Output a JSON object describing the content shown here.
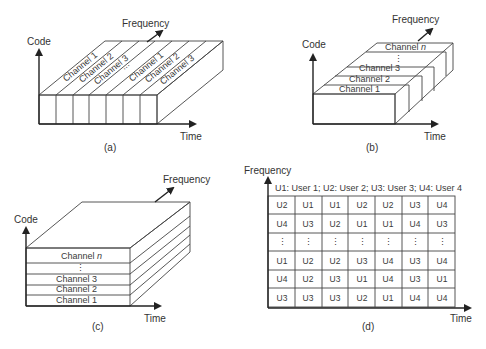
{
  "figure": {
    "panels": [
      {
        "id": "a",
        "caption": "(a)",
        "axes": {
          "x": "Time",
          "y": "Code",
          "z": "Frequency"
        },
        "channels": [
          "Channel 1",
          "Channel 2",
          "Channel 3",
          "...",
          "Channel 1",
          "Channel 2",
          "Channel 3"
        ],
        "time_slots": 7
      },
      {
        "id": "b",
        "caption": "(b)",
        "axes": {
          "x": "Time",
          "y": "Code",
          "z": "Frequency"
        },
        "channels": [
          "Channel 1",
          "Channel 2",
          "Channel 3",
          "⋮",
          "Channel n"
        ]
      },
      {
        "id": "c",
        "caption": "(c)",
        "axes": {
          "x": "Time",
          "y": "Code",
          "z": "Frequency"
        },
        "channels": [
          "Channel 1",
          "Channel 2",
          "Channel 3",
          "⋮",
          "Channel n"
        ]
      },
      {
        "id": "d",
        "caption": "(d)",
        "axes": {
          "x": "Time",
          "y": "Frequency"
        },
        "legend": "U1: User 1; U2: User 2;  U3: User 3;  U4: User 4",
        "grid": [
          [
            "U2",
            "U1",
            "U1",
            "U2",
            "U2",
            "U3",
            "U4"
          ],
          [
            "U4",
            "U3",
            "U2",
            "U1",
            "U1",
            "U4",
            "U3"
          ],
          [
            "⋮",
            "⋮",
            "⋮",
            "⋮",
            "⋮",
            "⋮",
            "⋮"
          ],
          [
            "U1",
            "U2",
            "U2",
            "U3",
            "U4",
            "U3",
            "U4"
          ],
          [
            "U4",
            "U2",
            "U3",
            "U1",
            "U4",
            "U3",
            "U1"
          ],
          [
            "U3",
            "U3",
            "U3",
            "U2",
            "U1",
            "U4",
            "U4"
          ]
        ]
      }
    ],
    "colors": {
      "line": "#444444",
      "axis": "#222222",
      "text": "#3a3a3a",
      "background": "#ffffff"
    }
  }
}
